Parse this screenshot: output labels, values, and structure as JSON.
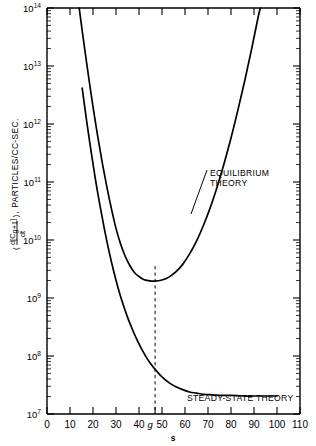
{
  "chart_data": {
    "type": "line",
    "title": "",
    "xlabel": "s",
    "ylabel": "( d[C g+1] / dt ) , PARTICLES/CC-SEC.",
    "ylabel_parts": {
      "open_paren": "(",
      "numerator_d": "d",
      "numerator_bracket_open": "[",
      "numerator_C": "C",
      "numerator_sub": "g+1",
      "numerator_bracket_close": "]",
      "denominator": "dt",
      "close_paren": ")",
      "comma": ",",
      "units": "PARTICLES/CC-SEC."
    },
    "xlim": [
      0,
      110
    ],
    "ylim_log": [
      7,
      14
    ],
    "yscale": "log",
    "xscale": "linear",
    "grid": false,
    "legend_position": "inline-annotations",
    "x_ticks": [
      0,
      10,
      20,
      30,
      40,
      50,
      60,
      70,
      80,
      90,
      100,
      110
    ],
    "x_tick_labels": [
      "0",
      "10",
      "20",
      "30",
      "40",
      "50",
      "60",
      "70",
      "80",
      "90",
      "100",
      "110"
    ],
    "y_ticks_log": [
      7,
      8,
      9,
      10,
      11,
      12,
      13,
      14
    ],
    "y_tick_labels": [
      "10⁷",
      "10⁸",
      "10⁹",
      "10¹⁰",
      "10¹¹",
      "10¹²",
      "10¹³",
      "10¹⁴"
    ],
    "y_tick_mantissas": [
      "10",
      "10",
      "10",
      "10",
      "10",
      "10",
      "10",
      "10"
    ],
    "y_tick_exponents": [
      "7",
      "8",
      "9",
      "10",
      "11",
      "12",
      "13",
      "14"
    ],
    "special_x_tick": {
      "label": "g",
      "value": 47
    },
    "reference_line": {
      "type": "vertical-dashed",
      "x": 47,
      "y_from_log": 7.0,
      "y_to_log": 9.55
    },
    "series": [
      {
        "name": "EQUILIBRIUM THEORY",
        "annotation": [
          "EQUILIBRIUM",
          "THEORY"
        ],
        "minimum": {
          "x": 47,
          "y_log": 9.3
        },
        "points_log": [
          [
            14.0,
            14.0
          ],
          [
            15.5,
            13.55
          ],
          [
            17.0,
            13.12
          ],
          [
            18.5,
            12.7
          ],
          [
            20.0,
            12.3
          ],
          [
            22.0,
            11.8
          ],
          [
            24.0,
            11.34
          ],
          [
            26.0,
            10.92
          ],
          [
            28.0,
            10.54
          ],
          [
            30.0,
            10.2
          ],
          [
            32.0,
            9.93
          ],
          [
            34.0,
            9.72
          ],
          [
            36.0,
            9.56
          ],
          [
            38.0,
            9.44
          ],
          [
            40.0,
            9.37
          ],
          [
            42.0,
            9.32
          ],
          [
            44.0,
            9.3
          ],
          [
            47.0,
            9.29
          ],
          [
            50.0,
            9.31
          ],
          [
            53.0,
            9.36
          ],
          [
            56.0,
            9.45
          ],
          [
            59.0,
            9.58
          ],
          [
            62.0,
            9.76
          ],
          [
            65.0,
            9.98
          ],
          [
            68.0,
            10.25
          ],
          [
            71.0,
            10.56
          ],
          [
            74.0,
            10.92
          ],
          [
            77.0,
            11.32
          ],
          [
            80.0,
            11.76
          ],
          [
            83.0,
            12.24
          ],
          [
            86.0,
            12.75
          ],
          [
            89.0,
            13.3
          ],
          [
            92.0,
            13.88
          ],
          [
            92.9,
            14.0
          ]
        ]
      },
      {
        "name": "STEADY-STATE THEORY",
        "annotation": [
          "STEADY-STATE THEORY"
        ],
        "points_log": [
          [
            15.3,
            12.62
          ],
          [
            17.0,
            12.12
          ],
          [
            19.0,
            11.57
          ],
          [
            21.0,
            11.06
          ],
          [
            23.0,
            10.6
          ],
          [
            25.0,
            10.18
          ],
          [
            27.0,
            9.8
          ],
          [
            29.0,
            9.46
          ],
          [
            31.0,
            9.16
          ],
          [
            33.0,
            8.9
          ],
          [
            35.0,
            8.67
          ],
          [
            37.0,
            8.47
          ],
          [
            39.0,
            8.29
          ],
          [
            41.0,
            8.13
          ],
          [
            43.0,
            7.99
          ],
          [
            45.0,
            7.87
          ],
          [
            47.0,
            7.77
          ],
          [
            50.0,
            7.64
          ],
          [
            53.0,
            7.54
          ],
          [
            56.0,
            7.47
          ],
          [
            59.0,
            7.42
          ],
          [
            62.0,
            7.38
          ],
          [
            65.0,
            7.36
          ],
          [
            68.0,
            7.34
          ],
          [
            72.0,
            7.33
          ],
          [
            76.0,
            7.32
          ],
          [
            80.0,
            7.32
          ],
          [
            85.0,
            7.31
          ],
          [
            90.0,
            7.31
          ],
          [
            95.0,
            7.31
          ],
          [
            100.0,
            7.31
          ]
        ]
      }
    ]
  }
}
